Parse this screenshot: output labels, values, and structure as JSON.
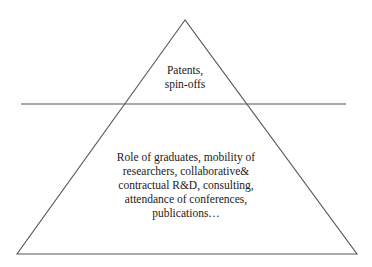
{
  "diagram": {
    "type": "pyramid",
    "stroke_color": "#555555",
    "background_color": "#ffffff",
    "divider": "horizontal line separating the apex section from the base section",
    "sections": [
      {
        "position": "top",
        "lines": [
          "Patents,",
          "spin-offs"
        ]
      },
      {
        "position": "bottom",
        "lines": [
          "Role of graduates, mobility of",
          "researchers, collaborative&",
          "contractual R&D, consulting,",
          "attendance of conferences,",
          "publications…"
        ]
      }
    ]
  }
}
